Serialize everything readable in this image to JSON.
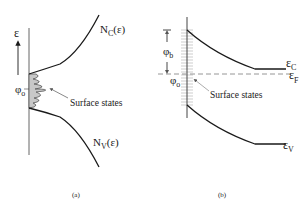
{
  "panel_a": {
    "caption": "(a)",
    "energy_axis_label": "ε",
    "phi_label": "φ",
    "phi_sub": "o",
    "nc_label": "N",
    "nc_sub": "C",
    "nc_arg": "(ε)",
    "nv_label": "N",
    "nv_sub": "V",
    "nv_arg": "(ε)",
    "surface_states_label": "Surface states"
  },
  "panel_b": {
    "caption": "(b)",
    "phi_b_label": "φ",
    "phi_b_sub": "b",
    "phi_o_label": "φ",
    "phi_o_sub": "o",
    "ec_label": "ε",
    "ec_sub": "C",
    "ef_label": "ε",
    "ef_sub": "F",
    "ev_label": "ε",
    "ev_sub": "V",
    "surface_states_label": "Surface states"
  },
  "colors": {
    "line": "#1a1a1a",
    "shade": "#c8c8c8",
    "hatch": "#9a9a9a",
    "dash": "#8a8a8a"
  }
}
